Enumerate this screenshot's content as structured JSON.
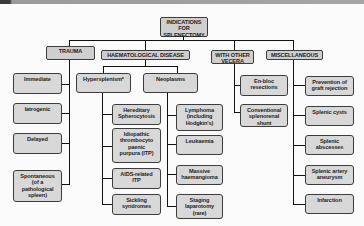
{
  "diagram": {
    "root": "INDICATIONS\nFOR\nSPLENECTOMY",
    "categories": {
      "trauma": {
        "label": "TRAUMA",
        "items": [
          "Immediate",
          "Iatrogenic",
          "Delayed",
          "Spontaneous\n(of a\npathological\nspleen)"
        ]
      },
      "haematological": {
        "label": "HAEMATOLOGICAL DISEASE",
        "hypersplenism": {
          "label": "Hypersplenism*",
          "items": [
            "Hereditary\nSpherocytosis",
            "Idiopathic\nthrombocyto\npaenic\npurpura (ITP)",
            "AIDS-related\nITP",
            "Sickling\nsyndromes"
          ]
        },
        "neoplasms": {
          "label": "Neoplasms",
          "items": [
            "Lymphoma\n(including\nHodgkin's)",
            "Leukaemia",
            "Massive\nhaemangioma",
            "Staging\nlaparotomy\n(rare)"
          ]
        }
      },
      "other_viscera": {
        "label": "WITH OTHER\nVECERA",
        "items": [
          "En-bloc\nresections",
          "Conventional\nsplenorenal\nshunt"
        ]
      },
      "miscellaneous": {
        "label": "MISCELLANEOUS",
        "items": [
          "Prevention of\ngraft rejection",
          "Splenic cysts",
          "Splenic\nabscesses",
          "Splenic artery\naneurysm",
          "Infarction"
        ]
      }
    }
  }
}
